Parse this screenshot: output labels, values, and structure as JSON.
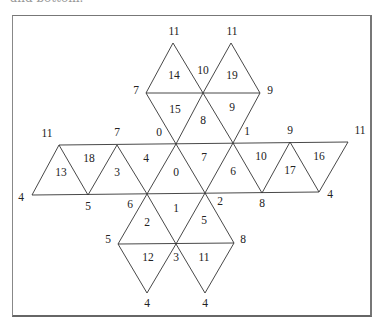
{
  "caption": {
    "clipped_text": "and bottom."
  },
  "diagram": {
    "edges": [
      [
        173,
        43,
        146,
        93
      ],
      [
        173,
        43,
        203,
        93
      ],
      [
        231,
        43,
        203,
        93
      ],
      [
        231,
        43,
        260,
        93
      ],
      [
        146,
        93,
        260,
        93
      ],
      [
        146,
        93,
        176,
        144
      ],
      [
        203,
        93,
        176,
        144
      ],
      [
        203,
        93,
        233,
        143
      ],
      [
        260,
        93,
        233,
        143
      ],
      [
        59,
        145,
        348,
        142
      ],
      [
        32,
        195,
        319,
        192
      ],
      [
        59,
        145,
        32,
        195
      ],
      [
        59,
        145,
        88,
        195
      ],
      [
        117,
        145,
        88,
        195
      ],
      [
        117,
        145,
        147,
        194
      ],
      [
        176,
        144,
        147,
        194
      ],
      [
        176,
        144,
        205,
        193
      ],
      [
        233,
        143,
        205,
        193
      ],
      [
        233,
        143,
        262,
        193
      ],
      [
        290,
        142,
        262,
        193
      ],
      [
        290,
        142,
        319,
        192
      ],
      [
        348,
        142,
        319,
        192
      ],
      [
        147,
        194,
        118,
        244
      ],
      [
        147,
        194,
        176,
        244
      ],
      [
        205,
        193,
        176,
        244
      ],
      [
        205,
        193,
        234,
        243
      ],
      [
        118,
        244,
        234,
        243
      ],
      [
        118,
        244,
        147,
        293
      ],
      [
        176,
        244,
        147,
        293
      ],
      [
        176,
        244,
        205,
        293
      ],
      [
        234,
        243,
        205,
        293
      ]
    ],
    "vertex_labels": [
      {
        "text": "11",
        "x": 174,
        "y": 32
      },
      {
        "text": "11",
        "x": 232,
        "y": 32
      },
      {
        "text": "7",
        "x": 136,
        "y": 91
      },
      {
        "text": "10",
        "x": 203,
        "y": 71
      },
      {
        "text": "9",
        "x": 270,
        "y": 91
      },
      {
        "text": "0",
        "x": 159,
        "y": 133
      },
      {
        "text": "1",
        "x": 247,
        "y": 132
      },
      {
        "text": "11",
        "x": 47,
        "y": 134
      },
      {
        "text": "7",
        "x": 117,
        "y": 133
      },
      {
        "text": "9",
        "x": 290,
        "y": 131
      },
      {
        "text": "11",
        "x": 360,
        "y": 131
      },
      {
        "text": "4",
        "x": 21,
        "y": 198
      },
      {
        "text": "5",
        "x": 88,
        "y": 207
      },
      {
        "text": "6",
        "x": 130,
        "y": 205
      },
      {
        "text": "2",
        "x": 220,
        "y": 202
      },
      {
        "text": "8",
        "x": 262,
        "y": 204
      },
      {
        "text": "4",
        "x": 330,
        "y": 195
      },
      {
        "text": "5",
        "x": 108,
        "y": 240
      },
      {
        "text": "8",
        "x": 243,
        "y": 240
      },
      {
        "text": "3",
        "x": 176,
        "y": 258
      },
      {
        "text": "4",
        "x": 147,
        "y": 304
      },
      {
        "text": "4",
        "x": 205,
        "y": 304
      }
    ],
    "face_labels": [
      {
        "text": "14",
        "x": 174,
        "y": 76
      },
      {
        "text": "19",
        "x": 232,
        "y": 76
      },
      {
        "text": "15",
        "x": 175,
        "y": 110
      },
      {
        "text": "8",
        "x": 203,
        "y": 121
      },
      {
        "text": "9",
        "x": 232,
        "y": 108
      },
      {
        "text": "18",
        "x": 89,
        "y": 159
      },
      {
        "text": "13",
        "x": 61,
        "y": 173
      },
      {
        "text": "3",
        "x": 117,
        "y": 173
      },
      {
        "text": "4",
        "x": 146,
        "y": 159
      },
      {
        "text": "0",
        "x": 176,
        "y": 173
      },
      {
        "text": "7",
        "x": 204,
        "y": 158
      },
      {
        "text": "6",
        "x": 233,
        "y": 172
      },
      {
        "text": "10",
        "x": 261,
        "y": 157
      },
      {
        "text": "17",
        "x": 290,
        "y": 171
      },
      {
        "text": "16",
        "x": 319,
        "y": 157
      },
      {
        "text": "2",
        "x": 147,
        "y": 223
      },
      {
        "text": "1",
        "x": 176,
        "y": 209
      },
      {
        "text": "5",
        "x": 204,
        "y": 221
      },
      {
        "text": "12",
        "x": 148,
        "y": 258
      },
      {
        "text": "11",
        "x": 204,
        "y": 258
      }
    ]
  }
}
